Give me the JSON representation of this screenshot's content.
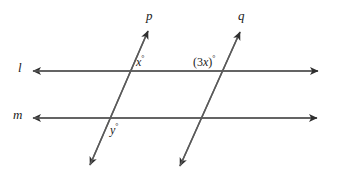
{
  "figure": {
    "type": "geometry-diagram",
    "stroke_color": "#4a4a4a",
    "text_color": "#1b1b1b",
    "background_color": "#ffffff"
  },
  "lines": {
    "l": {
      "label": "l",
      "orientation": "horizontal",
      "y": 71,
      "x_start": 33,
      "x_end": 318,
      "arrows": "both"
    },
    "m": {
      "label": "m",
      "orientation": "horizontal",
      "y": 118,
      "x_start": 33,
      "x_end": 317,
      "arrows": "both"
    },
    "p": {
      "label": "p",
      "orientation": "transversal",
      "x1": 90,
      "y1": 165,
      "x2": 148,
      "y2": 31,
      "arrows": "both"
    },
    "q": {
      "label": "q",
      "orientation": "transversal",
      "x1": 180,
      "y1": 166,
      "x2": 240,
      "y2": 32,
      "arrows": "both"
    }
  },
  "angles": {
    "x": {
      "text": "x",
      "degree_symbol": "°",
      "location": "above-right of intersection of p and l"
    },
    "three_x": {
      "open_paren": "(",
      "coefficient": "3",
      "variable": "x",
      "close_paren": ")",
      "degree_symbol": "°",
      "location": "above-left of intersection of q and l"
    },
    "y": {
      "text": "y",
      "degree_symbol": "°",
      "location": "below-right of intersection of p and m"
    }
  }
}
